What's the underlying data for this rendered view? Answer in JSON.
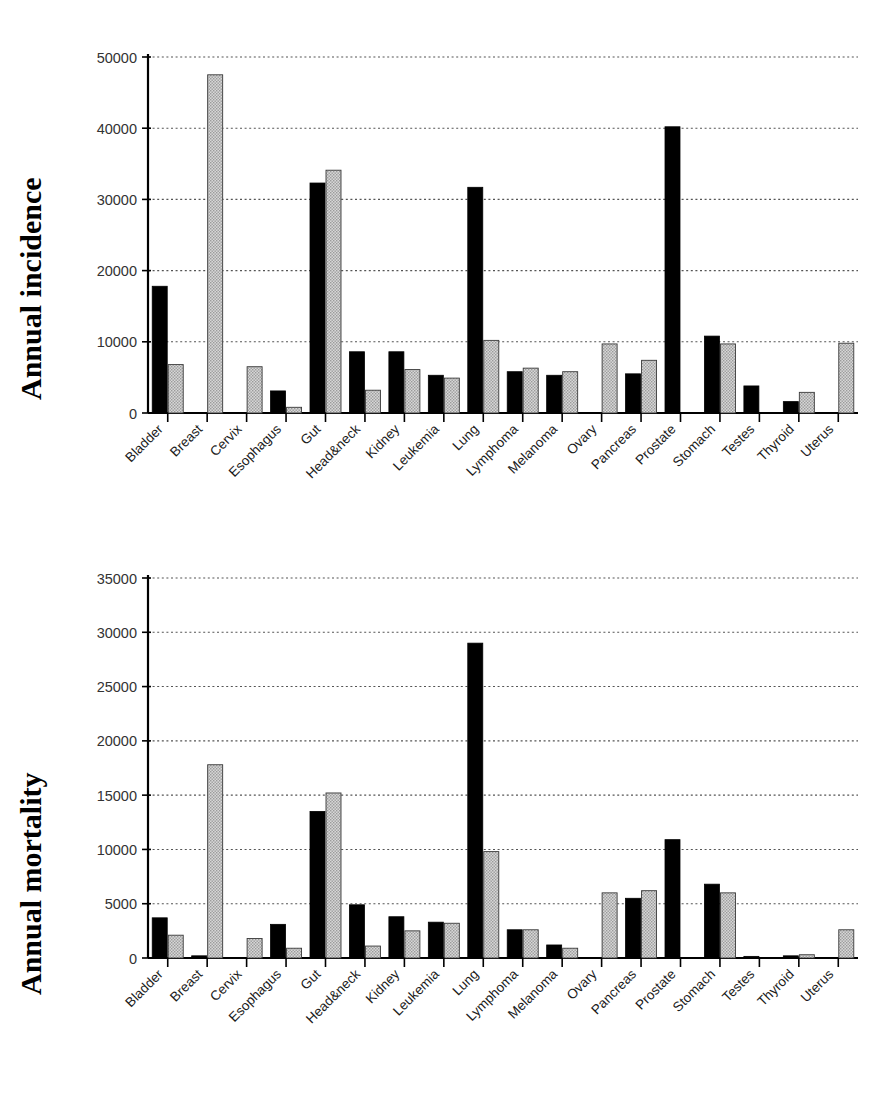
{
  "figure": {
    "caption": ""
  },
  "charts": [
    {
      "id": "incidence",
      "ylabel": "Annual incidence"
    },
    {
      "id": "mortality",
      "ylabel": "Annual mortality"
    }
  ],
  "chart_data": [
    {
      "type": "bar",
      "title": "",
      "subtitle": "",
      "xlabel": "",
      "ylabel": "Annual incidence",
      "ylim": [
        0,
        50000
      ],
      "yticks": [
        0,
        10000,
        20000,
        30000,
        40000,
        50000
      ],
      "ytick_labels": [
        "0",
        "10000",
        "20000",
        "30000",
        "40000",
        "50000"
      ],
      "grid": true,
      "grid_style": "dotted-horizontal",
      "legend": "none",
      "categories": [
        "Bladder",
        "Breast",
        "Cervix",
        "Esophagus",
        "Gut",
        "Head&neck",
        "Kidney",
        "Leukemia",
        "Lung",
        "Lymphoma",
        "Melanoma",
        "Ovary",
        "Pancreas",
        "Prostate",
        "Stomach",
        "Testes",
        "Thyroid",
        "Uterus"
      ],
      "series": [
        {
          "name": "male",
          "fill": "black",
          "color": "#000000",
          "values": [
            17800,
            0,
            0,
            3100,
            32300,
            8600,
            8600,
            5300,
            31700,
            5800,
            5300,
            0,
            5500,
            40200,
            10800,
            3800,
            1600,
            0
          ]
        },
        {
          "name": "female",
          "fill": "gray-hatched",
          "color": "#c9c9c9",
          "values": [
            6800,
            47500,
            6500,
            800,
            34100,
            3200,
            6100,
            4900,
            10200,
            6300,
            5800,
            9700,
            7400,
            0,
            9700,
            0,
            2900,
            9800
          ]
        }
      ]
    },
    {
      "type": "bar",
      "title": "",
      "subtitle": "",
      "xlabel": "",
      "ylabel": "Annual mortality",
      "ylim": [
        0,
        35000
      ],
      "yticks": [
        0,
        5000,
        10000,
        15000,
        20000,
        25000,
        30000,
        35000
      ],
      "ytick_labels": [
        "0",
        "5000",
        "10000",
        "15000",
        "20000",
        "25000",
        "30000",
        "35000"
      ],
      "grid": true,
      "grid_style": "dotted-horizontal",
      "legend": "none",
      "categories": [
        "Bladder",
        "Breast",
        "Cervix",
        "Esophagus",
        "Gut",
        "Head&neck",
        "Kidney",
        "Leukemia",
        "Lung",
        "Lymphoma",
        "Melanoma",
        "Ovary",
        "Pancreas",
        "Prostate",
        "Stomach",
        "Testes",
        "Thyroid",
        "Uterus"
      ],
      "series": [
        {
          "name": "male",
          "fill": "black",
          "color": "#000000",
          "values": [
            3700,
            200,
            0,
            3100,
            13500,
            4900,
            3800,
            3300,
            29000,
            2600,
            1200,
            0,
            5500,
            10900,
            6800,
            150,
            200,
            0
          ]
        },
        {
          "name": "female",
          "fill": "gray-hatched",
          "color": "#c9c9c9",
          "values": [
            2100,
            17800,
            1800,
            900,
            15200,
            1100,
            2500,
            3200,
            9800,
            2600,
            900,
            6000,
            6200,
            0,
            6000,
            0,
            300,
            2600
          ]
        }
      ]
    }
  ]
}
